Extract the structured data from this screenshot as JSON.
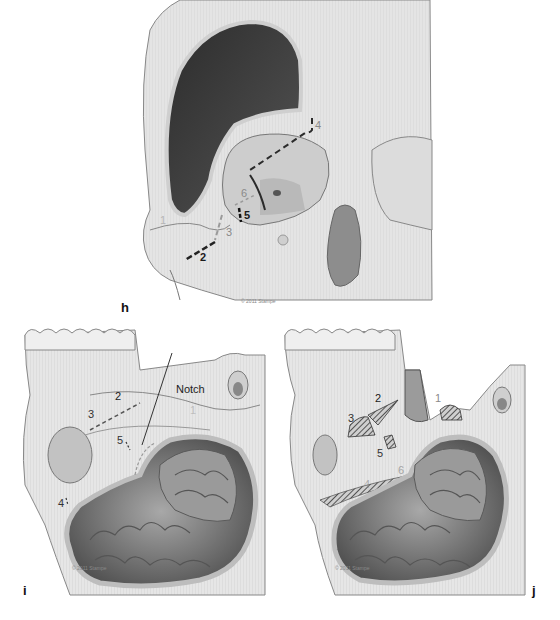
{
  "figure": {
    "panels": [
      {
        "id": "h",
        "letter": "h",
        "view": "frontal-oblique skull view with planned osteotomy lines",
        "labels": {
          "n2": "2",
          "n3": "3",
          "n4": "4",
          "n5": "5",
          "n6": "6",
          "n1": "1"
        },
        "copyright": "© 2011 Stampe"
      },
      {
        "id": "i",
        "letter": "i",
        "view": "lateral view with frontotemporal craniotomy and exposed brain",
        "labels": {
          "n1": "1",
          "n2": "2",
          "n3": "3",
          "n4": "4",
          "n5": "5"
        },
        "callout": "Notch",
        "copyright": "© 2011 Stampe"
      },
      {
        "id": "j",
        "letter": "j",
        "view": "lateral view after orbitozygomatic cuts with hatched bone edges",
        "labels": {
          "n1": "1",
          "n2": "2",
          "n3": "3",
          "n4": "4",
          "n5": "5",
          "n6": "6"
        },
        "copyright": "© 2011 Stampe"
      }
    ],
    "colors": {
      "bone": "#e6e6e6",
      "bone_shadow": "#c9c9c9",
      "outline": "#6f6f6f",
      "cavity": "#3c3c3c",
      "brain": "#8e8e8e",
      "cut_line_dark": "#2b2b2b",
      "cut_line_light": "#8c8c8c"
    }
  }
}
